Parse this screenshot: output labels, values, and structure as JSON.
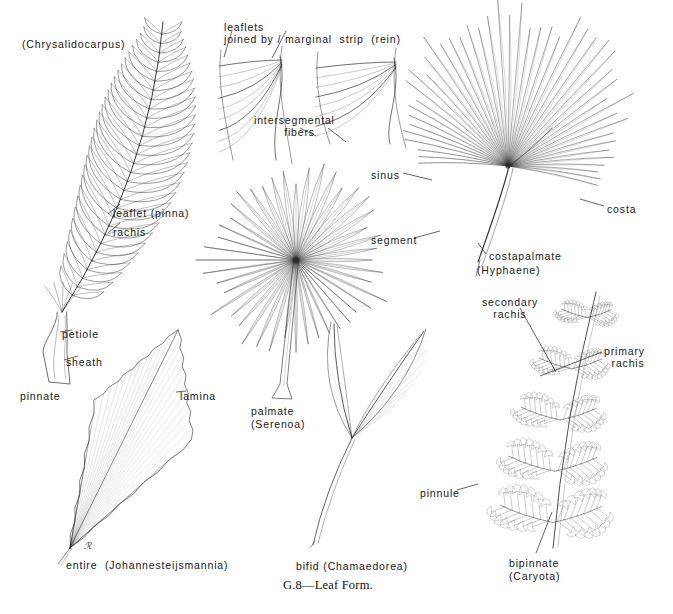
{
  "figure": {
    "caption": "G.8—Leaf Form.",
    "background": "#ffffff",
    "ink": "#2b2b2b",
    "width": 673,
    "height": 614
  },
  "labels": [
    {
      "id": "chrysalidocarpus",
      "text": "(Chrysalidocarpus)",
      "x": 22,
      "y": 38,
      "align": "left"
    },
    {
      "id": "leaflet-pinna",
      "text": "leaflet (pinna)",
      "x": 113,
      "y": 207,
      "align": "left"
    },
    {
      "id": "rachis",
      "text": "rachis",
      "x": 113,
      "y": 226,
      "align": "left"
    },
    {
      "id": "petiole",
      "text": "petiole",
      "x": 62,
      "y": 328,
      "align": "left"
    },
    {
      "id": "sheath",
      "text": "sheath",
      "x": 66,
      "y": 356,
      "align": "left"
    },
    {
      "id": "pinnate",
      "text": "pinnate",
      "x": 20,
      "y": 390,
      "align": "left"
    },
    {
      "id": "lamina",
      "text": "lamina",
      "x": 180,
      "y": 390,
      "align": "left"
    },
    {
      "id": "entire",
      "text": "entire  (Johannesteijsmannia)",
      "x": 66,
      "y": 559,
      "align": "left"
    },
    {
      "id": "leaflets-joined",
      "text": "leaflets\njoined by / marginal  strip  (rein)",
      "x": 224,
      "y": 21,
      "align": "left"
    },
    {
      "id": "intersegmental",
      "text": "intersegmental\n        fibers",
      "x": 254,
      "y": 114,
      "align": "left"
    },
    {
      "id": "sinus",
      "text": "sinus",
      "x": 371,
      "y": 169,
      "align": "left"
    },
    {
      "id": "segment",
      "text": "segment",
      "x": 371,
      "y": 234,
      "align": "left"
    },
    {
      "id": "costa",
      "text": "costa",
      "x": 607,
      "y": 203,
      "align": "left"
    },
    {
      "id": "costapalmate",
      "text": "costapalmate",
      "x": 489,
      "y": 250,
      "align": "left"
    },
    {
      "id": "hyphaene",
      "text": "(Hyphaene)",
      "x": 477,
      "y": 264,
      "align": "left"
    },
    {
      "id": "palmate",
      "text": "palmate",
      "x": 251,
      "y": 405,
      "align": "left"
    },
    {
      "id": "serenoa",
      "text": "(Serenoa)",
      "x": 251,
      "y": 418,
      "align": "left"
    },
    {
      "id": "bifid",
      "text": "bifid (Chamaedorea)",
      "x": 296,
      "y": 560,
      "align": "left"
    },
    {
      "id": "secondary-rachis",
      "text": "secondary\n   rachis",
      "x": 482,
      "y": 296,
      "align": "left"
    },
    {
      "id": "primary-rachis",
      "text": "primary\n  rachis",
      "x": 604,
      "y": 345,
      "align": "left"
    },
    {
      "id": "pinnule",
      "text": "pinnule",
      "x": 420,
      "y": 487,
      "align": "left"
    },
    {
      "id": "bipinnate",
      "text": "bipinnate",
      "x": 509,
      "y": 557,
      "align": "left"
    },
    {
      "id": "caryota",
      "text": "(Caryota)",
      "x": 509,
      "y": 570,
      "align": "left"
    }
  ],
  "entire_mark": {
    "text": "ℛ",
    "x": 84,
    "y": 541
  },
  "leaders": [
    {
      "id": "leader-leaflet-pinna",
      "path": "M108,214 L120,204"
    },
    {
      "id": "leader-rachis",
      "path": "M108,233 L120,223"
    },
    {
      "id": "leader-petiole",
      "path": "M60,332 L72,330"
    },
    {
      "id": "leader-sheath",
      "path": "M64,360 L78,356"
    },
    {
      "id": "leader-lamina",
      "path": "M176,392 L186,391"
    },
    {
      "id": "leader-sinus",
      "path": "M403,173 L432,180"
    },
    {
      "id": "leader-segment",
      "path": "M414,238 L440,231"
    },
    {
      "id": "leader-costa",
      "path": "M604,206 L580,199"
    },
    {
      "id": "leader-costapalmate",
      "path": "M486,254 L478,243"
    },
    {
      "id": "leader-pinnule",
      "path": "M457,490 L478,484"
    },
    {
      "id": "leader-leaflets-joined",
      "path": "M232,31 L224,57"
    },
    {
      "id": "leader-marginal-strip",
      "path": "M286,31 L272,58"
    },
    {
      "id": "leader-interseg-a",
      "path": "M300,128 L316,136"
    },
    {
      "id": "leader-interseg-b",
      "path": "M328,128 L346,142"
    },
    {
      "id": "leader-secondary-rachis",
      "path": "M520,308 L556,372"
    },
    {
      "id": "leader-primary-rachis",
      "path": "M602,352 L540,376"
    },
    {
      "id": "leader-bipinnate",
      "path": "M536,553 L552,512"
    }
  ],
  "specimens": [
    {
      "id": "pinnate-leaf",
      "name": "pinnate-leaf-chrysalidocarpus",
      "type": "pinnate",
      "tip": [
        163,
        22
      ],
      "base": [
        62,
        312
      ],
      "curve": [
        150,
        175
      ],
      "leaflet_count": 30,
      "leaflet_len_max": 62,
      "petiole": {
        "top": [
          62,
          312
        ],
        "narrow": [
          58,
          336
        ],
        "sheath_top": [
          56,
          344
        ],
        "sheath_bottom": [
          60,
          382
        ],
        "width_sheath": 26,
        "width_petiole": 9
      }
    },
    {
      "id": "entire-leaf",
      "name": "entire-leaf-johannesteijsmannia",
      "type": "entire",
      "apex": [
        178,
        330
      ],
      "base": [
        70,
        548
      ],
      "left": [
        96,
        400
      ],
      "right": [
        192,
        440
      ],
      "pleats": 22
    },
    {
      "id": "palmate-leaf",
      "name": "palmate-leaf-serenoa",
      "type": "palmate",
      "hub": [
        296,
        260
      ],
      "radius": 88,
      "segments": 44,
      "petiole": {
        "top": [
          296,
          260
        ],
        "bottom": [
          283,
          398
        ],
        "flare": 11
      }
    },
    {
      "id": "costapalmate-leaf",
      "name": "costapalmate-leaf-hyphaene",
      "type": "costapalmate",
      "hub": [
        508,
        166
      ],
      "radius": 142,
      "segments": 46,
      "arc_start_deg": 186,
      "arc_end_deg": 368,
      "costa": {
        "from": [
          478,
          262
        ],
        "to": [
          509,
          166
        ],
        "extend": [
          552,
          128
        ]
      }
    },
    {
      "id": "bifid-leaf",
      "name": "bifid-leaf-chamaedorea",
      "type": "bifid",
      "base": [
        313,
        545
      ],
      "fork": [
        352,
        438
      ],
      "lobe_left_tip": [
        331,
        322
      ],
      "lobe_right_tip": [
        426,
        329
      ],
      "veins": 9
    },
    {
      "id": "bipinnate-leaf",
      "name": "bipinnate-leaf-caryota",
      "type": "bipinnate",
      "base": [
        553,
        548
      ],
      "apex": [
        596,
        292
      ],
      "secondary_count": 5,
      "pinnules_per_side": 7
    },
    {
      "id": "detail-left",
      "name": "detail-leaflets-joined-marginal-strip",
      "type": "detail-fibers",
      "box": [
        215,
        50,
        75,
        110
      ],
      "fiber_count": 9
    },
    {
      "id": "detail-right",
      "name": "detail-intersegmental-fibers",
      "type": "detail-fibers",
      "box": [
        312,
        52,
        92,
        92
      ],
      "fiber_count": 8
    }
  ]
}
